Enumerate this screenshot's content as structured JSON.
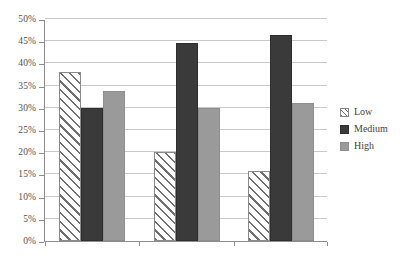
{
  "chart_data": {
    "type": "bar",
    "title": "",
    "subtitle": "",
    "xlabel": "",
    "ylabel": "",
    "categories": [
      "White",
      "Black",
      "Hispanic"
    ],
    "series": [
      {
        "name": "Low",
        "values": [
          38.0,
          20.0,
          15.8
        ],
        "color": "#ffffff",
        "pattern": "diagonal-hatch"
      },
      {
        "name": "Medium",
        "values": [
          30.0,
          44.5,
          46.3
        ],
        "color": "#3a3a3a",
        "pattern": "solid"
      },
      {
        "name": "High",
        "values": [
          33.7,
          30.0,
          31.0
        ],
        "color": "#9a9a9a",
        "pattern": "solid"
      }
    ],
    "ylim": [
      0,
      50
    ],
    "ytick_values": [
      0,
      5,
      10,
      15,
      20,
      25,
      30,
      35,
      40,
      45,
      50
    ],
    "ytick_labels": [
      "0%",
      "5%",
      "10%",
      "15%",
      "20%",
      "25%",
      "30%",
      "35%",
      "40%",
      "45%",
      "50%"
    ],
    "value_format": "percent",
    "grid": {
      "horizontal": true,
      "vertical": false,
      "color": "#c9c9c9"
    },
    "legend": {
      "position": "right",
      "entries": [
        "Low",
        "Medium",
        "High"
      ]
    },
    "axis_color": "#8d8d8d",
    "background": "#ffffff"
  }
}
